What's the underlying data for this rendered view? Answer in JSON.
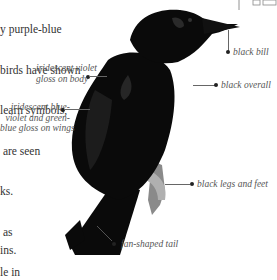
{
  "body_text": {
    "lines": [
      "y purple-blue",
      "birds have shown",
      "learn symbols,",
      " are seen",
      "ks.",
      " as",
      "le in"
    ],
    "bottom_fragment": "ins."
  },
  "illustration": {
    "subject": "crow-illustration",
    "labels": {
      "bill": "black bill",
      "overall": "black overall",
      "body_gloss": "iridescent violet\ngloss on body",
      "wing_gloss": "iridescent blue-\nviolet and green-\nblue gloss on wings",
      "legs": "black legs and feet",
      "tail": "fan-shaped tail"
    }
  },
  "colors": {
    "bird": "#0a0a0a",
    "legs": "#8a8a8a",
    "text": "#333333",
    "label": "#555555"
  }
}
